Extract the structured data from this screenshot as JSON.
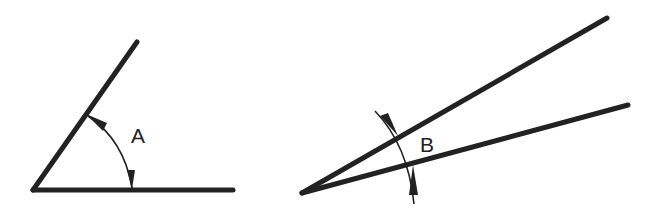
{
  "figure": {
    "angles": [
      {
        "id": "angle-a",
        "label": "A",
        "description": "Wide angle with arc dimension arrows inside the angle",
        "vertex": [
          33,
          190
        ],
        "ray1_end": [
          137,
          42
        ],
        "ray2_end": [
          233,
          190
        ]
      },
      {
        "id": "angle-b",
        "label": "B",
        "description": "Narrow angle with arc dimension arrows pointing in from outside",
        "vertex": [
          302,
          193
        ],
        "ray1_end": [
          607,
          18
        ],
        "ray2_end": [
          628,
          105
        ]
      }
    ],
    "colors": {
      "line": "#222222",
      "background": "#ffffff"
    }
  }
}
